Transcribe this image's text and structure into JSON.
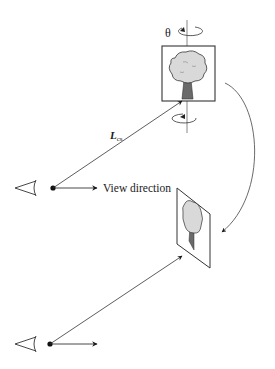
{
  "figure": {
    "colors": {
      "line": "#2a2a2a",
      "canopy_fill": "#d9d9d9",
      "trunk_fill": "#6a6a6a",
      "background": "#ffffff"
    }
  },
  "labels": {
    "theta": "θ",
    "distance_main": "L",
    "distance_sub": "cs",
    "view_direction": "View direction"
  },
  "scene_top": {
    "viewer": "eye-icon",
    "billboard": "tree-billboard-facing-front",
    "rotation_axis": "vertical",
    "rotation_indicator": "rotation-arrow-icon"
  },
  "scene_bottom": {
    "viewer": "eye-icon",
    "billboard": "tree-billboard-rotated"
  },
  "transition_arrow": "curved-arrow-icon"
}
